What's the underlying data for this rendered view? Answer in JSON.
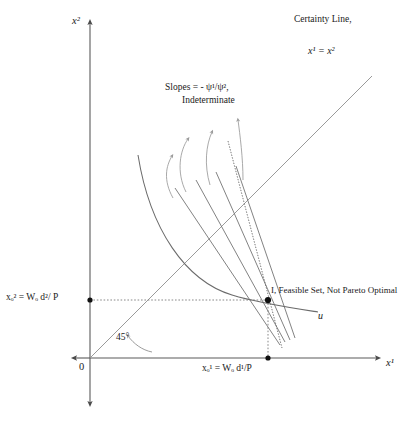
{
  "figure": {
    "axes": {
      "y_axis_label": "x²",
      "x_axis_label": "x¹",
      "origin_label": "0"
    },
    "annotations": {
      "certainty_line_label": "Certainty Line,",
      "certainty_line_equation": "x¹ = x²",
      "slopes_label": "Slopes =  -  ψ¹/ψ²,",
      "indeterminate_label": "Indeterminate",
      "feasible_set_label": "I, Feasible Set, Not Pareto Optimal",
      "indifference_curve_label": "u",
      "angle_label": "45°",
      "y_intercept_label": "xₒ² = Wₒ d²/ P",
      "x_intercept_label": "xₒ¹ = Wₒ d¹/P"
    },
    "colors": {
      "axis": "#5a5a5a",
      "curve": "#6b6b6b",
      "certainty_line": "#8a8a8a",
      "budget_line": "#6b6b6b",
      "dotted_guide": "#7a7a7a",
      "arrow": "#9a9a9a",
      "point": "#111111",
      "text": "#1a1a1a",
      "background": "#ffffff"
    },
    "geometry": {
      "origin": [
        90,
        358
      ],
      "equilibrium_point": [
        268,
        300
      ],
      "x_axis_dot": [
        268,
        358
      ],
      "y_axis_dot": [
        90,
        300
      ],
      "certainty_line_from": [
        90,
        358
      ],
      "certainty_line_to": [
        372,
        76
      ],
      "fan_line_count": 5,
      "arrow_count": 4
    }
  }
}
